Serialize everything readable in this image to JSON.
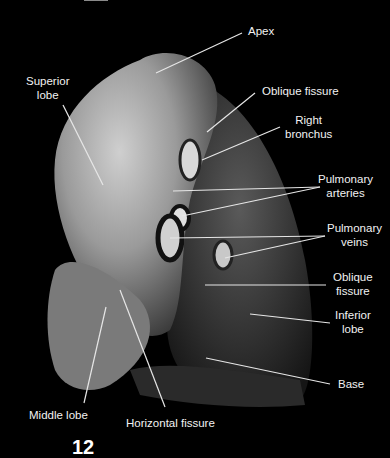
{
  "figure": {
    "figure_number_partial": "12",
    "colors": {
      "background": "#000000",
      "label_text": "#f2f2f2",
      "leader_line": "#e6e6e6"
    }
  },
  "labels": [
    {
      "id": "apex",
      "text": "Apex"
    },
    {
      "id": "superior-lobe",
      "line1": "Superior",
      "line2": "lobe"
    },
    {
      "id": "oblique-fissure-top",
      "text": "Oblique fissure"
    },
    {
      "id": "right-bronchus",
      "line1": "Right",
      "line2": "bronchus"
    },
    {
      "id": "pulmonary-arteries",
      "line1": "Pulmonary",
      "line2": "arteries"
    },
    {
      "id": "pulmonary-veins",
      "line1": "Pulmonary",
      "line2": "veins"
    },
    {
      "id": "oblique-fissure-bottom",
      "line1": "Oblique",
      "line2": "fissure"
    },
    {
      "id": "inferior-lobe",
      "line1": "Inferior",
      "line2": "lobe"
    },
    {
      "id": "base",
      "text": "Base"
    },
    {
      "id": "middle-lobe",
      "text": "Middle lobe"
    },
    {
      "id": "horizontal-fissure",
      "text": "Horizontal fissure"
    }
  ]
}
